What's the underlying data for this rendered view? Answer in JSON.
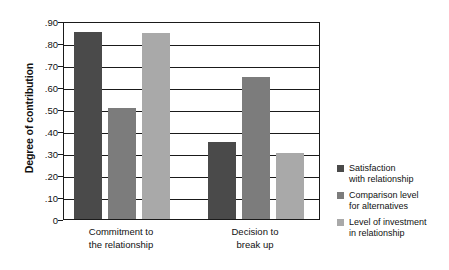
{
  "chart_data": {
    "type": "bar",
    "title": "",
    "xlabel": "",
    "ylabel": "Degree of contribution",
    "ylim": [
      0,
      0.9
    ],
    "grid": true,
    "legend_position": "right",
    "categories": [
      "Commitment to\nthe relationship",
      "Decision to\nbreak up"
    ],
    "category_labels": [
      {
        "line1": "Commitment to",
        "line2": "the relationship"
      },
      {
        "line1": "Decision to",
        "line2": "break up"
      }
    ],
    "ytick_labels": [
      ".90",
      ".80",
      ".70",
      ".60",
      ".50",
      ".40",
      ".30",
      ".20",
      ".10",
      "0"
    ],
    "ytick_values": [
      0.9,
      0.8,
      0.7,
      0.6,
      0.5,
      0.4,
      0.3,
      0.2,
      0.1,
      0
    ],
    "series": [
      {
        "name": "Satisfaction with relationship",
        "legend_line1": "Satisfaction",
        "legend_line2": "with relationship",
        "color": "#4a4a4a",
        "values": [
          0.85,
          0.35
        ]
      },
      {
        "name": "Comparison level for alternatives",
        "legend_line1": "Comparison level",
        "legend_line2": "for alternatives",
        "color": "#7c7c7c",
        "values": [
          0.505,
          0.645
        ]
      },
      {
        "name": "Level of investment in relationship",
        "legend_line1": "Level of investment",
        "legend_line2": "in relationship",
        "color": "#a9a9a9",
        "values": [
          0.845,
          0.3
        ]
      }
    ]
  },
  "colors": {
    "axis": "#1a1a1a",
    "text": "#111111",
    "background": "#ffffff",
    "series_dark": "#4a4a4a",
    "series_medium": "#7c7c7c",
    "series_light": "#a9a9a9"
  }
}
